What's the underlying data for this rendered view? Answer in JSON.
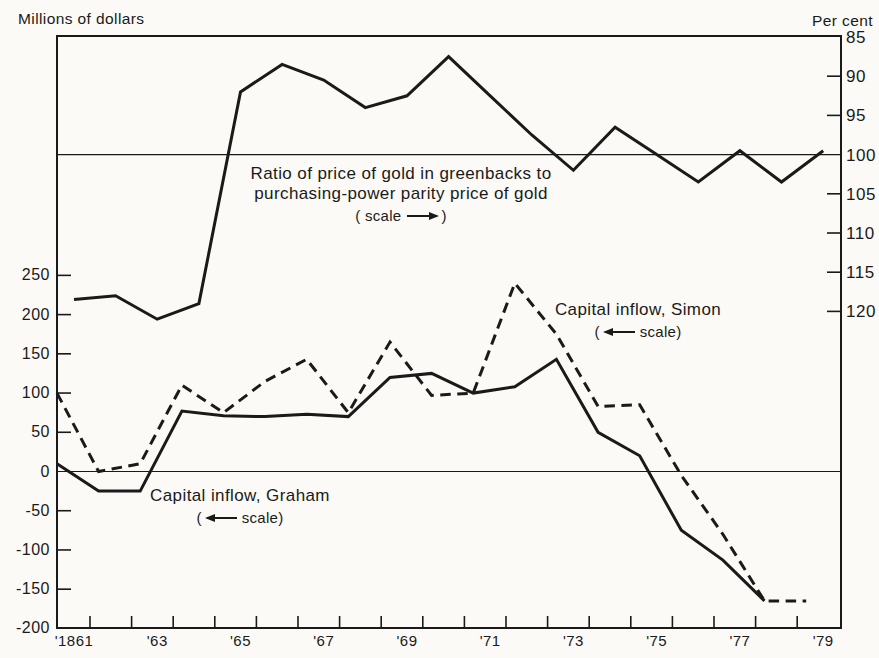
{
  "page": {
    "background": "#fbfaf6",
    "ink": "#1a1a1a"
  },
  "chart_data": {
    "type": "line",
    "title": "",
    "x": {
      "start_year": 1861,
      "end_year": 1879,
      "label_years": [
        1861,
        1863,
        1865,
        1867,
        1869,
        1871,
        1873,
        1875,
        1877,
        1879
      ],
      "labels": [
        "'1861",
        "'63",
        "'65",
        "'67",
        "'69",
        "'71",
        "'73",
        "'75",
        "'77",
        "'79"
      ]
    },
    "left_axis": {
      "title": "Millions of dollars",
      "ticks": [
        250,
        200,
        150,
        100,
        50,
        0,
        -50,
        -100,
        -150,
        -200
      ],
      "tick_labels": [
        "250",
        "200",
        "150",
        "100",
        "50",
        "0",
        "-50",
        "-100",
        "-150",
        "-200"
      ],
      "range": [
        -200,
        250
      ],
      "gridline_at": 0
    },
    "right_axis": {
      "title": "Per cent",
      "ticks": [
        85,
        90,
        95,
        100,
        105,
        110,
        115,
        120
      ],
      "tick_labels": [
        "85",
        "90",
        "95",
        "100",
        "105",
        "110",
        "115",
        "120"
      ],
      "range": [
        85,
        120
      ],
      "inverted": true,
      "gridline_at": 100
    },
    "series": [
      {
        "name": "Ratio of price of gold in greenbacks to purchasing-power parity price of gold",
        "axis": "right",
        "line_style": "solid",
        "start_year": 1861,
        "values": [
          118.5,
          118,
          121,
          119,
          92,
          88.5,
          90.5,
          94,
          92.5,
          87.5,
          92.5,
          97.5,
          102,
          96.5,
          100,
          103.5,
          99.5,
          103.5,
          99.5
        ]
      },
      {
        "name": "Capital inflow, Simon",
        "axis": "left",
        "line_style": "dashed",
        "start_year": 1861,
        "values": [
          100,
          0,
          10,
          110,
          75,
          115,
          143,
          75,
          165,
          97,
          100,
          240,
          175,
          83,
          85,
          -5,
          -80,
          -165,
          -165
        ]
      },
      {
        "name": "Capital inflow, Graham",
        "axis": "left",
        "line_style": "solid",
        "start_year": 1861,
        "values": [
          10,
          -25,
          -25,
          77,
          71,
          70,
          73,
          70,
          120,
          125,
          100,
          108,
          143,
          50,
          20,
          -75,
          -113,
          -165
        ]
      }
    ],
    "annotations": [
      {
        "id": "gold-ratio-label",
        "lines": [
          "Ratio of price of gold in greenbacks to",
          "purchasing-power parity price of gold"
        ],
        "scale_note": {
          "open": "(",
          "label": "scale",
          "close": ")",
          "arrow": "right"
        }
      },
      {
        "id": "simon-label",
        "lines": [
          "Capital inflow, Simon"
        ],
        "scale_note": {
          "open": "(",
          "label": "scale",
          "close": ")",
          "arrow": "left"
        }
      },
      {
        "id": "graham-label",
        "lines": [
          "Capital inflow, Graham"
        ],
        "scale_note": {
          "open": "(",
          "label": "scale",
          "close": ")",
          "arrow": "left"
        }
      }
    ]
  }
}
